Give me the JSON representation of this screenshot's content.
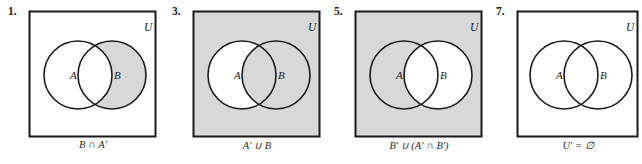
{
  "figure": {
    "kind": "venn-diagram-set",
    "panel_count": 4,
    "colors": {
      "shade": "#d8d8d8",
      "stroke": "#1a1a1a",
      "background": "#ffffff"
    }
  },
  "panels": [
    {
      "number": "1.",
      "universe_label": "U",
      "circle_a_label": "A",
      "circle_b_label": "B",
      "caption": "B ∩ A′",
      "shaded_regions": [
        "b-only"
      ],
      "universe_shaded": false
    },
    {
      "number": "3.",
      "universe_label": "U",
      "circle_a_label": "A",
      "circle_b_label": "B",
      "caption": "A′ ∪ B",
      "shaded_regions": [
        "outside",
        "overlap",
        "b-only"
      ],
      "universe_shaded": true
    },
    {
      "number": "5.",
      "universe_label": "U",
      "circle_a_label": "A",
      "circle_b_label": "B",
      "caption": "B′ ∪ (A′ ∩ B′)",
      "shaded_regions": [
        "outside",
        "a-only"
      ],
      "universe_shaded": true
    },
    {
      "number": "7.",
      "universe_label": "U",
      "circle_a_label": "A",
      "circle_b_label": "B",
      "caption": "U′ = ∅",
      "shaded_regions": [],
      "universe_shaded": false
    }
  ]
}
